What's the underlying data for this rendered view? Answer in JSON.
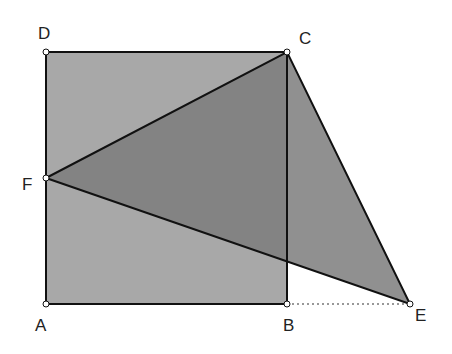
{
  "diagram": {
    "type": "geometry",
    "points": {
      "A": {
        "label": "A",
        "x": 46,
        "y": 304
      },
      "B": {
        "label": "B",
        "x": 287,
        "y": 304
      },
      "C": {
        "label": "C",
        "x": 287,
        "y": 52
      },
      "D": {
        "label": "D",
        "x": 46,
        "y": 52
      },
      "E": {
        "label": "E",
        "x": 410,
        "y": 304
      },
      "F": {
        "label": "F",
        "x": 46,
        "y": 178
      }
    },
    "shapes": [
      {
        "name": "square ABCD",
        "fill": "#a8a8a8"
      },
      {
        "name": "triangle FCE",
        "fill": "#7c7c7c"
      }
    ],
    "segments": [
      "AB",
      "BC",
      "CD",
      "DA",
      "FC",
      "CE",
      "FE"
    ],
    "dashed_segments": [
      "BE"
    ],
    "colors": {
      "stroke": "#111111",
      "square_fill": "#a8a8a8",
      "triangle_fill": "#7c7c7c",
      "triangle_outside_fill": "#8c8c8c"
    }
  }
}
